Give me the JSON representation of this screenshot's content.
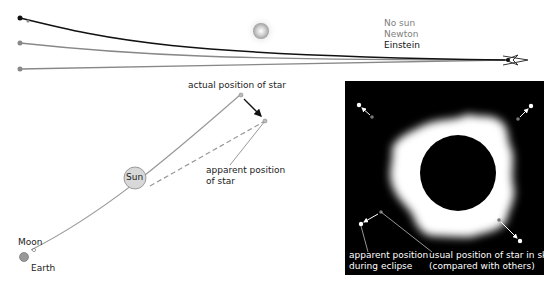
{
  "top_panel": {
    "legend": [
      {
        "label": "No sun",
        "color": "#808080"
      },
      {
        "label": "Newton",
        "color": "#808080"
      },
      {
        "label": "Einstein",
        "color": "#111111"
      }
    ],
    "icons": {
      "sun": "sun-icon",
      "observer": "eye-icon"
    }
  },
  "left_panel": {
    "labels": {
      "actual": "actual position of star",
      "apparent_line1": "apparent position",
      "apparent_line2": "of star",
      "sun": "Sun",
      "moon": "Moon",
      "earth": "Earth"
    }
  },
  "right_panel": {
    "background": "#000000",
    "labels": {
      "apparent_line1": "apparent position",
      "apparent_line2": "during eclipse",
      "usual_line1": "usual position of star in sky",
      "usual_line2": "(compared with others)"
    }
  }
}
